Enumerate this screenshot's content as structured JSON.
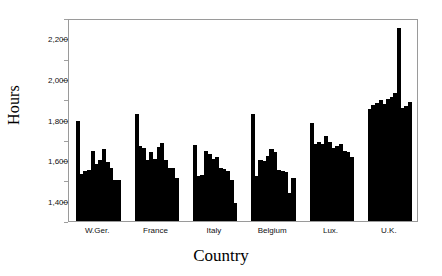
{
  "chart_data": {
    "type": "bar",
    "title": "",
    "subtitle": "",
    "xlabel": "Country",
    "ylabel": "Hours",
    "ylim": [
      1300,
      2300
    ],
    "ytick_values": [
      1400,
      1600,
      1800,
      2000,
      2200
    ],
    "ytick_labels": [
      "1,400",
      "1,600",
      "1,800",
      "2,000",
      "2,200"
    ],
    "yminor_values": [
      1300,
      1500,
      1700,
      1900,
      2100,
      2300
    ],
    "grid": false,
    "legend": null,
    "legend_position": "none",
    "bar_color": "#000000",
    "frame_color": "#9a9a9a",
    "categories": [
      "W.Ger.",
      "France",
      "Italy",
      "Belgium",
      "Lux.",
      "U.K."
    ],
    "note": "Grouped histogram: each country contains a run of narrow bars (annual/industry series). Values read off the Hours axis.",
    "groups": [
      {
        "name": "W.Ger.",
        "values": [
          1795,
          1530,
          1545,
          1550,
          1645,
          1580,
          1600,
          1655,
          1590,
          1560,
          1500,
          1500
        ]
      },
      {
        "name": "France",
        "values": [
          1825,
          1670,
          1660,
          1600,
          1640,
          1605,
          1665,
          1685,
          1600,
          1560,
          1560,
          1510
        ]
      },
      {
        "name": "Italy",
        "values": [
          1675,
          1520,
          1525,
          1645,
          1630,
          1605,
          1615,
          1560,
          1555,
          1545,
          1500,
          1390
        ]
      },
      {
        "name": "Belgium",
        "values": [
          1825,
          1520,
          1600,
          1595,
          1620,
          1655,
          1640,
          1550,
          1545,
          1540,
          1440,
          1510
        ]
      },
      {
        "name": "Lux.",
        "values": [
          1785,
          1680,
          1690,
          1680,
          1720,
          1690,
          1660,
          1670,
          1680,
          1645,
          1640,
          1615
        ]
      },
      {
        "name": "U.K.",
        "values": [
          1850,
          1870,
          1880,
          1895,
          1875,
          1900,
          1910,
          1930,
          2250,
          1855,
          1865,
          1885
        ]
      }
    ]
  }
}
